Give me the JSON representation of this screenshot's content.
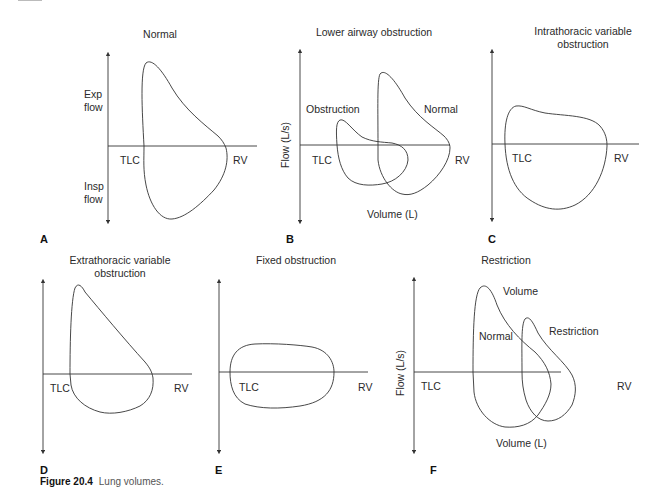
{
  "figure": {
    "number": "Figure 20.4",
    "caption": "Lung volumes."
  },
  "panels": [
    {
      "letter": "A",
      "title": [
        "Normal"
      ],
      "labels": {
        "tlc": "TLC",
        "rv": "RV",
        "exp_flow": [
          "Exp",
          "flow"
        ],
        "insp_flow": [
          "Insp",
          "flow"
        ]
      }
    },
    {
      "letter": "B",
      "title": [
        "Lower airway obstruction"
      ],
      "labels": {
        "tlc": "TLC",
        "rv": "RV",
        "y_axis": "Flow (L/s)",
        "x_axis": "Volume (L)",
        "curve1": "Obstruction",
        "curve2": "Normal"
      }
    },
    {
      "letter": "C",
      "title": [
        "Intrathoracic variable",
        "obstruction"
      ],
      "labels": {
        "tlc": "TLC",
        "rv": "RV"
      }
    },
    {
      "letter": "D",
      "title": [
        "Extrathoracic variable",
        "obstruction"
      ],
      "labels": {
        "tlc": "TLC",
        "rv": "RV"
      }
    },
    {
      "letter": "E",
      "title": [
        "Fixed obstruction"
      ],
      "labels": {
        "tlc": "TLC",
        "rv": "RV"
      }
    },
    {
      "letter": "F",
      "title": [
        "Restriction"
      ],
      "labels": {
        "tlc": "TLC",
        "rv": "RV",
        "y_axis": "Flow (L/s)",
        "x_axis": "Volume (L)",
        "curve1": "Normal",
        "curve1_extra": "Volume",
        "curve2": "Restriction"
      }
    }
  ]
}
